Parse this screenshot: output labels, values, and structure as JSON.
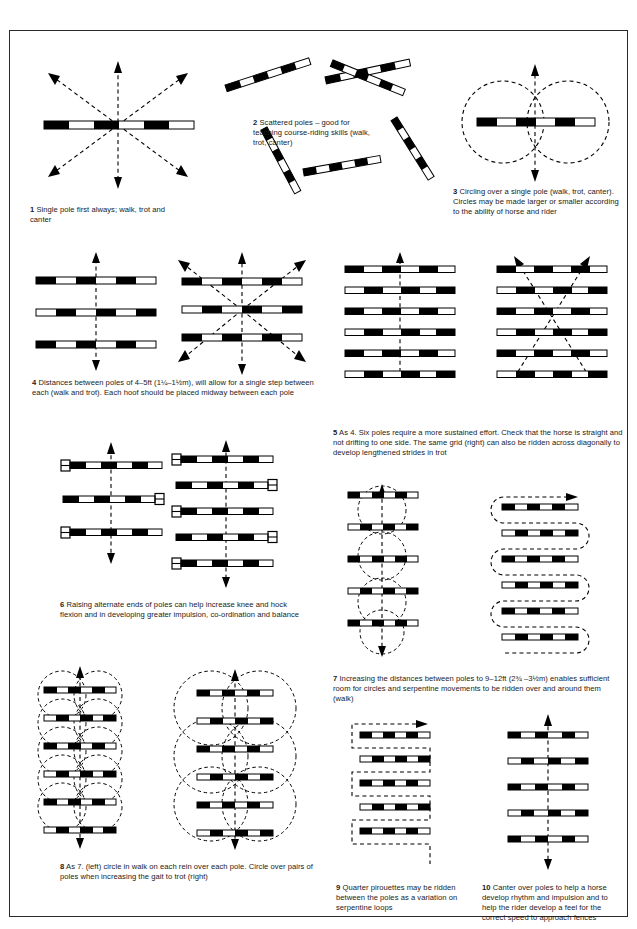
{
  "page": {
    "width": 637,
    "height": 929,
    "ink_color": "#000000",
    "paper_color": "#ffffff"
  },
  "figures": [
    {
      "number": "1",
      "caption": "Single pole first always; walk, trot and canter",
      "caption_lines": [
        "Single pole first always; walk,",
        "trot and canter"
      ],
      "poles": 1,
      "track": "eight-direction arrows"
    },
    {
      "number": "2",
      "caption": "Scattered poles – good for teaching course-riding skills (walk, trot, canter)",
      "caption_lines": [
        "Scattered poles – good for",
        "teaching course-riding skills",
        "(walk, trot, canter)"
      ],
      "poles": 6,
      "track": "scattered, no path shown"
    },
    {
      "number": "3",
      "caption": "Circling over a single pole (walk, trot, canter). Circles may be made larger or smaller according to the ability of horse and rider",
      "caption_lines": [
        "Circling over a single pole (walk, trot,",
        "canter). Circles may be made larger or",
        "smaller according to the ability of horse",
        "and rider"
      ],
      "poles": 1,
      "track": "two circles, figure of eight"
    },
    {
      "number": "4",
      "caption": "Distances between poles of 4–5ft (1¼–1½m), will allow for  a single step between each (walk and trot).  Each hoof should be placed midway between each pole",
      "caption_lines": [
        "Distances between poles of 4–5ft (1¼–1½m), will allow for  a single",
        "step between each (walk and trot).  Each hoof should be placed midway",
        "between each pole"
      ],
      "poles": 3,
      "poles_right": 3,
      "track": "straight arrow (left), eight-direction arrows (right)",
      "distance_ft": "4–5ft",
      "distance_m": "1¼–1½m"
    },
    {
      "number": "5",
      "caption": "As 4. Six poles require a more sustained effort. Check that the horse is straight and not drifting to one side. The same grid (right) can also be ridden across diagonally to develop lengthened strides in trot",
      "caption_lines": [
        "As 4. Six poles require a more sustained effort. Check that the horse is",
        "straight and not drifting to one side. The same grid (right) can also be",
        "ridden across diagonally to develop lengthened strides in trot"
      ],
      "poles": 6,
      "poles_right": 6,
      "track": "straight arrow (left), crossing diagonals (right)"
    },
    {
      "number": "6",
      "caption": "Raising alternate ends of poles can help increase knee and hock flexion and in developing greater impulsion, co-ordination and balance",
      "caption_lines": [
        "Raising alternate ends of poles can help increase knee and",
        "hock flexion and in developing greater impulsion, co-ordination",
        "and balance"
      ],
      "poles": 3,
      "poles_right": 5,
      "track": "straight arrow",
      "detail": "alternate pole ends raised on blocks"
    },
    {
      "number": "7",
      "caption": "Increasing the distances between poles to 9–12ft (2¾ –3½m) enables sufficient room for circles and serpentine movements to be ridden over and around them (walk)",
      "caption_lines": [
        "Increasing the distances between poles to 9–12ft (2¾ –3½m)",
        "enables sufficient room for circles and serpentine movements to",
        "be ridden over and around them (walk)"
      ],
      "poles": 5,
      "poles_right": 6,
      "track": "circles (left), serpentine loops (right)",
      "distance_ft": "9–12ft",
      "distance_m": "2¾ –3½m"
    },
    {
      "number": "8",
      "caption": "As 7. (left) circle in walk on each rein over each pole. Circle over pairs of poles when increasing the gait to trot (right)",
      "caption_lines": [
        "As 7. (left) circle in walk on each rein over each pole. Circle over pairs",
        "of poles when increasing the gait to trot (right)"
      ],
      "poles": 6,
      "poles_right": 6,
      "track": "small circles each pole (left), large circles over pairs (right)"
    },
    {
      "number": "9",
      "caption": "Quarter pirouettes may be ridden between the poles as a variation on  serpentine loops",
      "caption_lines": [
        "Quarter pirouettes may be",
        "ridden between the poles as a",
        "variation on  serpentine loops"
      ],
      "poles": 5,
      "track": "square-cornered serpentine"
    },
    {
      "number": "10",
      "caption": "Canter over poles to help a horse develop rhythm and impulsion and to help the rider develop a feel for the correct speed to approach fences",
      "caption_lines": [
        "Canter over poles to help a horse",
        "develop rhythm and impulsion and to",
        "help the rider develop a feel for the",
        "correct speed to approach fences"
      ],
      "poles": 5,
      "track": "straight arrow"
    }
  ]
}
